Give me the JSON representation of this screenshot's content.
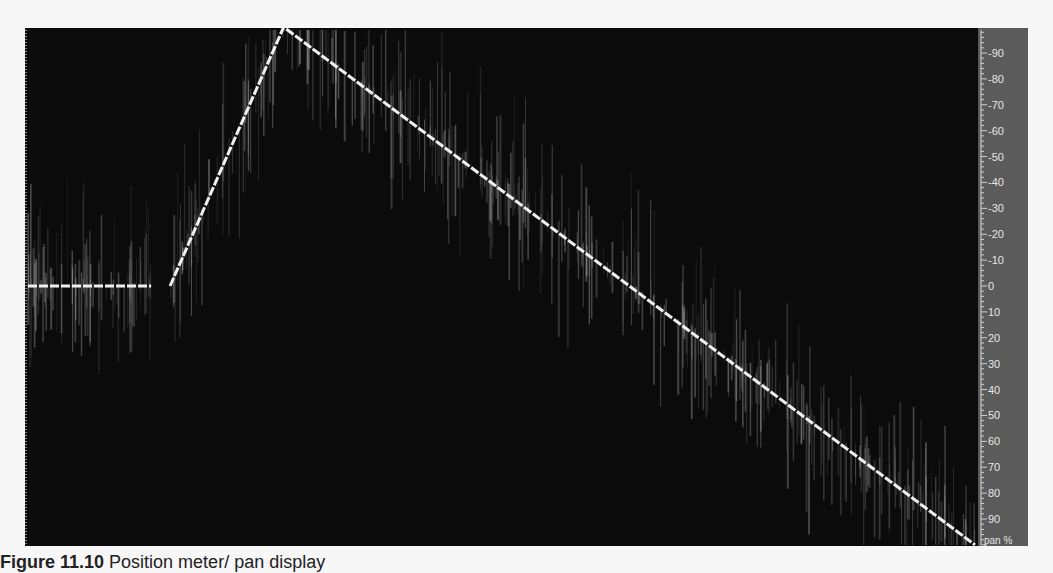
{
  "chart_data": {
    "type": "line",
    "title": "",
    "xlabel": "",
    "ylabel": "pan %",
    "y_axis_position": "right",
    "y_tick_labels": [
      "90",
      "80",
      "70",
      "60",
      "50",
      "40",
      "30",
      "20",
      "10",
      "0",
      "10",
      "20",
      "30",
      "40",
      "50",
      "60",
      "70",
      "80",
      "90",
      "pan %"
    ],
    "y_tick_values": [
      -90,
      -80,
      -70,
      -60,
      -50,
      -40,
      -30,
      -20,
      -10,
      0,
      10,
      20,
      30,
      40,
      50,
      60,
      70,
      80,
      90
    ],
    "ylim": [
      -100,
      100
    ],
    "grid": false,
    "background": "#0b0b0b",
    "trace_color": "#f0f0f0",
    "series": [
      {
        "name": "pan position",
        "x": [
          0,
          13,
          15,
          27,
          100
        ],
        "values": [
          0,
          0,
          0,
          -100,
          100
        ]
      }
    ]
  },
  "caption": {
    "label": "Figure 11.10",
    "text": "Position meter/ pan display"
  }
}
